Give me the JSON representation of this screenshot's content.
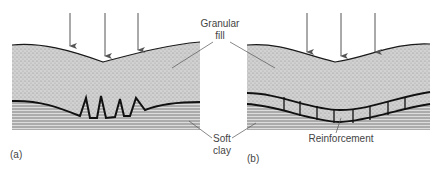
{
  "figure": {
    "panels": [
      {
        "id": "a",
        "label": "(a)",
        "description": "Unreinforced granular fill over soft clay; fill punches into clay"
      },
      {
        "id": "b",
        "label": "(b)",
        "description": "Reinforced granular fill over soft clay; reinforcement layer spreads load"
      }
    ],
    "labels": {
      "granular_fill_line1": "Granular",
      "granular_fill_line2": "fill",
      "soft_clay_line1": "Soft",
      "soft_clay_line2": "clay",
      "reinforcement": "Reinforcement"
    },
    "load_arrows_per_panel": 3,
    "colors": {
      "fill_stipple": "#c8c8c8",
      "clay_lines": "#7a7a7a",
      "outline": "#1a1a1a",
      "label_text": "#444444"
    }
  }
}
